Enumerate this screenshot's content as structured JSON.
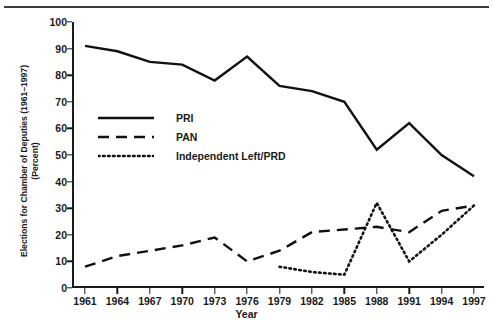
{
  "chart_data": {
    "type": "line",
    "title": "",
    "xlabel": "Year",
    "ylabel": "Elections for Chamber of Deputies (1961–1997)\n(Percent)",
    "categories": [
      "1961",
      "1964",
      "1967",
      "1970",
      "1973",
      "1976",
      "1979",
      "1982",
      "1985",
      "1988",
      "1991",
      "1994",
      "1997"
    ],
    "x": [
      1961,
      1964,
      1967,
      1970,
      1973,
      1976,
      1979,
      1982,
      1985,
      1988,
      1991,
      1994,
      1997
    ],
    "ylim": [
      0,
      100
    ],
    "yticks": [
      0,
      10,
      20,
      30,
      40,
      50,
      60,
      70,
      80,
      90,
      100
    ],
    "grid": false,
    "legend_position": "inside-upper-left",
    "series": [
      {
        "name": "PRI",
        "style": "solid",
        "color": "#111111",
        "values": [
          91,
          89,
          85,
          84,
          78,
          87,
          76,
          74,
          70,
          52,
          62,
          50,
          42
        ]
      },
      {
        "name": "PAN",
        "style": "dashed",
        "color": "#111111",
        "values": [
          8,
          12,
          14,
          16,
          19,
          10,
          14,
          21,
          22,
          23,
          21,
          29,
          31
        ]
      },
      {
        "name": "Independent Left/PRD",
        "style": "dotted",
        "color": "#111111",
        "values": [
          null,
          null,
          null,
          null,
          null,
          null,
          8,
          6,
          5,
          32,
          10,
          20,
          31
        ]
      }
    ]
  },
  "axis": {
    "y_tick_labels": [
      "0",
      "10",
      "20",
      "30",
      "40",
      "50",
      "60",
      "70",
      "80",
      "90",
      "100"
    ],
    "x_tick_labels": [
      "1961",
      "1964",
      "1967",
      "1970",
      "1973",
      "1976",
      "1979",
      "1982",
      "1985",
      "1988",
      "1991",
      "1994",
      "1997"
    ],
    "x_title": "Year",
    "y_title": "Elections for Chamber of Deputies (1961–1997)\n(Percent)"
  },
  "legend": {
    "items": [
      {
        "label": "PRI",
        "style": "solid"
      },
      {
        "label": "PAN",
        "style": "dashed"
      },
      {
        "label": "Independent Left/PRD",
        "style": "dotted"
      }
    ]
  }
}
